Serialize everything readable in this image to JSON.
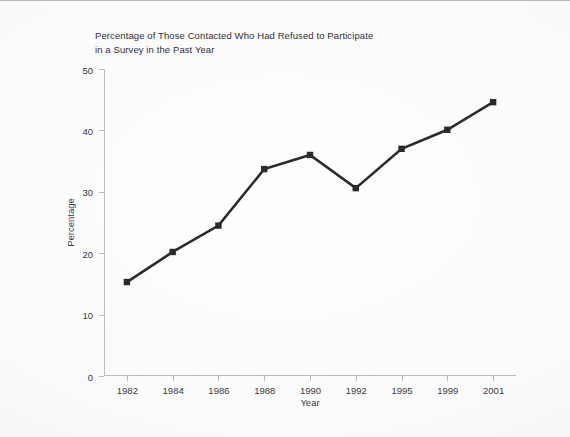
{
  "chart_data": {
    "type": "line",
    "title": "Percentage of Those Contacted Who Had Refused to Participate\nin a Survey in the Past Year",
    "xlabel": "Year",
    "ylabel": "Percentage",
    "categories": [
      "1982",
      "1984",
      "1986",
      "1988",
      "1990",
      "1992",
      "1995",
      "1999",
      "2001"
    ],
    "values": [
      15.3,
      20.2,
      24.5,
      33.7,
      36.0,
      30.6,
      37.0,
      40.1,
      44.6
    ],
    "series": [
      {
        "name": "Refused to participate",
        "values": [
          15.3,
          20.2,
          24.5,
          33.7,
          36.0,
          30.6,
          37.0,
          40.1,
          44.6
        ]
      }
    ],
    "ylim": [
      0,
      50
    ],
    "yticks": [
      0,
      10,
      20,
      30,
      40,
      50
    ],
    "ytick_labels": [
      "0",
      "10",
      "20",
      "30",
      "40",
      "50"
    ],
    "grid": false,
    "legend": "none",
    "marker": "square",
    "line_color": "#2b2b2b",
    "marker_color": "#2b2b2b",
    "axis_color": "#bcbcbc",
    "text_color": "#3a3a3e",
    "background_color": "#fbfbfb"
  }
}
